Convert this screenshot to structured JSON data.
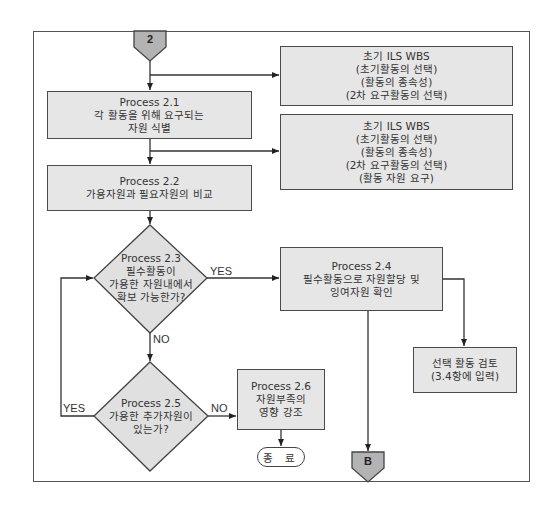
{
  "connectors": {
    "start": "2",
    "end": "B"
  },
  "wbs_box_1": {
    "lines": [
      "초기 ILS WBS",
      "(초기활동의 선택)",
      "(활동의 종속성)",
      "(2차 요구활동의 선택)"
    ]
  },
  "wbs_box_2": {
    "lines": [
      "초기 ILS WBS",
      "(초기활동의 선택)",
      "(활동의 종속성)",
      "(2차 요구활동의 선택)",
      "(활동 자원 요구)"
    ]
  },
  "process_2_1": {
    "lines": [
      "Process 2.1",
      "각 활동을 위해 요구되는",
      "자원 식별"
    ]
  },
  "process_2_2": {
    "lines": [
      "Process 2.2",
      "가용자원과 필요자원의 비교"
    ]
  },
  "process_2_3": {
    "lines": [
      "Process 2.3",
      "필수활동이",
      "가용한 자원내에서",
      "확보 가능한가?"
    ]
  },
  "process_2_4": {
    "lines": [
      "Process 2.4",
      "필수활동으로 자원할당 및",
      "잉여자원 확인"
    ]
  },
  "process_2_5": {
    "lines": [
      "Process 2.5",
      "가용한 추가자원이",
      "있는가?"
    ]
  },
  "process_2_6": {
    "lines": [
      "Process 2.6",
      "자원부족의",
      "영향 강조"
    ]
  },
  "review_box": {
    "lines": [
      "선택 활동 검토",
      "(3.4항에 입력)"
    ]
  },
  "terminal": {
    "label": "종 료"
  },
  "labels": {
    "yes_2_3": "YES",
    "no_2_3": "NO",
    "yes_2_5": "YES",
    "no_2_5": "NO"
  },
  "colors": {
    "box_fill": "#e6e6e6",
    "connector_fill": "#b3b3b3",
    "line": "#444444"
  }
}
